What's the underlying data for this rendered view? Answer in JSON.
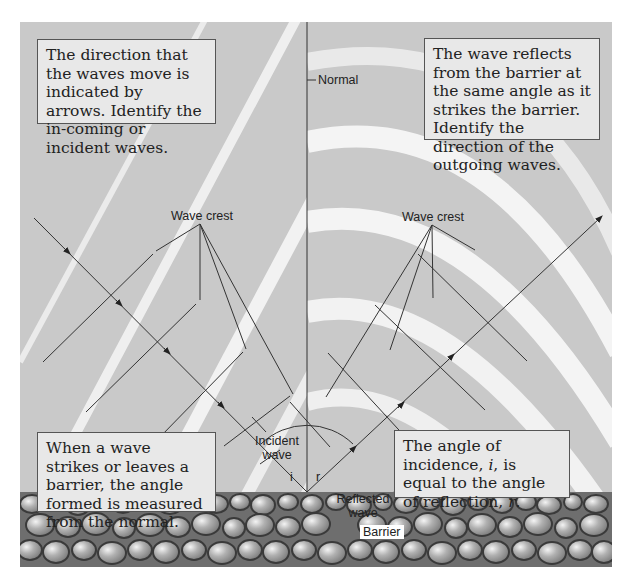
{
  "diagram": {
    "labels": {
      "normal": "Normal",
      "wave_crest_left": "Wave crest",
      "wave_crest_right": "Wave crest",
      "incident_wave_line1": "Incident",
      "incident_wave_line2": "wave",
      "reflected_wave_line1": "Reflected",
      "reflected_wave_line2": "wave",
      "angle_i": "i",
      "angle_r": "r",
      "barrier": "Barrier"
    },
    "callouts": {
      "top_left": "The direction that the waves move is indicated by arrows. Identify the in-coming or incident waves.",
      "top_right": "The wave reflects from the barrier at the same angle as it strikes the barrier. Identify the direction of the outgoing waves.",
      "bottom_left": "When a wave strikes or leaves a barrier, the angle formed is measured from the normal.",
      "bottom_right_pre": "The angle of incidence, ",
      "bottom_right_i": "i",
      "bottom_right_mid": ", is equal to the angle of reflection, ",
      "bottom_right_r": "r",
      "bottom_right_post": "."
    },
    "colors": {
      "background": "#c9c9c9",
      "callout_fill": "#e8e8e8",
      "line": "#333333",
      "stone": "#9a9a9a"
    }
  }
}
